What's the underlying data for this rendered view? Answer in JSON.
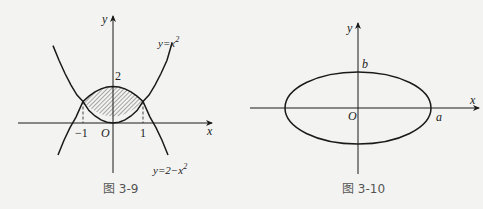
{
  "figures": [
    {
      "caption": "图 3-9",
      "axes": {
        "x_label": "x",
        "y_label": "y",
        "origin_label": "O"
      },
      "ticks": {
        "x_neg": "−1",
        "x_pos": "1",
        "y_top": "2"
      },
      "curves": [
        {
          "label_base": "y=x",
          "label_exp": "2",
          "equation": "y = x^2"
        },
        {
          "label_base": "y=2−x",
          "label_exp": "2",
          "equation": "y = 2 - x^2"
        }
      ],
      "shaded_region": "region between y=x^2 and y=2-x^2 for -1<=x<=1 (hatched)",
      "intersections": [
        [
          -1,
          1
        ],
        [
          1,
          1
        ]
      ]
    },
    {
      "caption": "图 3-10",
      "axes": {
        "x_label": "x",
        "y_label": "y",
        "origin_label": "O"
      },
      "ticks": {
        "semi_major": "a",
        "semi_minor": "b"
      },
      "curve": "ellipse x^2/a^2 + y^2/b^2 = 1"
    }
  ],
  "colors": {
    "background": "#f3f3f1",
    "stroke": "#1a1a1a",
    "caption": "#555555"
  }
}
